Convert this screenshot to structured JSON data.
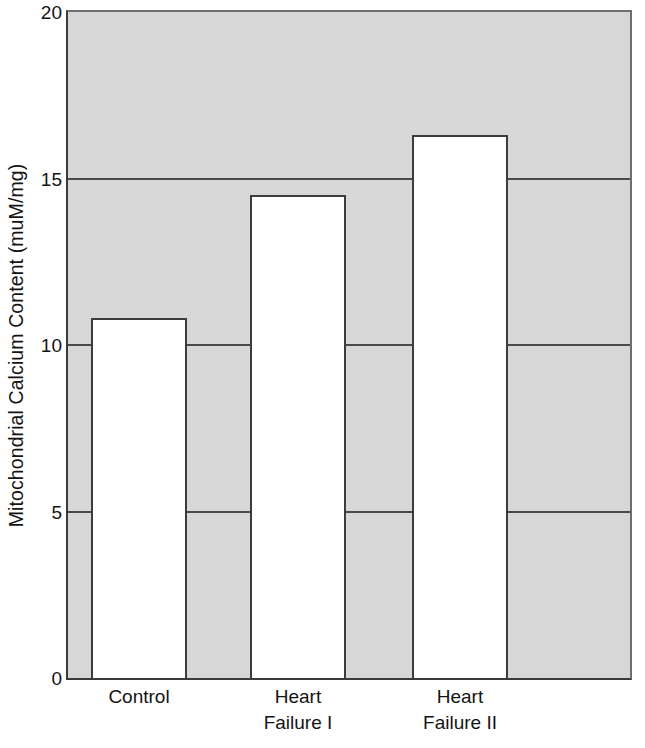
{
  "chart_data": {
    "type": "bar",
    "title": "",
    "subtitle": "",
    "xlabel": "",
    "ylabel": "Mitochondrial Calcium Content (muM/mg)",
    "categories": [
      "Control",
      "Heart Failure I",
      "Heart Failure II"
    ],
    "category_lines": [
      [
        "Control",
        ""
      ],
      [
        "Heart",
        "Failure I"
      ],
      [
        "Heart",
        "Failure II"
      ]
    ],
    "values": [
      10.8,
      14.5,
      16.3
    ],
    "ylim": [
      0,
      20
    ],
    "yticks": [
      0,
      5,
      10,
      15,
      20
    ],
    "ytick_labels": [
      "0",
      "5",
      "10",
      "15",
      "20"
    ],
    "grid": true,
    "gridlines_at": [
      5,
      10,
      15
    ],
    "legend": null,
    "legend_position": "none",
    "annotations": [],
    "colors": {
      "plot_background": "#d7d7d7",
      "bar_fill": "#ffffff",
      "bar_border": "#3c3c3c",
      "gridline": "#4a4a4a",
      "axis": "#3a3a3a",
      "text": "#141414",
      "page_background": "#ffffff"
    }
  }
}
